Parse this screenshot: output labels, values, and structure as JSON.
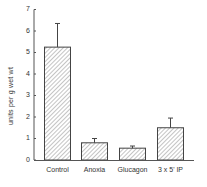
{
  "chart_data": {
    "type": "bar",
    "title": "",
    "xlabel": "",
    "ylabel": "units per g wet wt",
    "ylim": [
      0,
      7
    ],
    "yticks": [
      0,
      1,
      2,
      3,
      4,
      5,
      6,
      7
    ],
    "categories": [
      "Control",
      "Anoxia",
      "Glucagon",
      "3 x 5' IP"
    ],
    "values": [
      5.25,
      0.8,
      0.55,
      1.5
    ],
    "error_upper": [
      6.35,
      1.0,
      0.65,
      1.95
    ],
    "bar_style": "diagonal-hatch",
    "grid": false,
    "legend": null
  },
  "colors": {
    "axis": "#555555",
    "bar_edge": "#444444",
    "hatch": "#888888",
    "text": "#333333"
  }
}
